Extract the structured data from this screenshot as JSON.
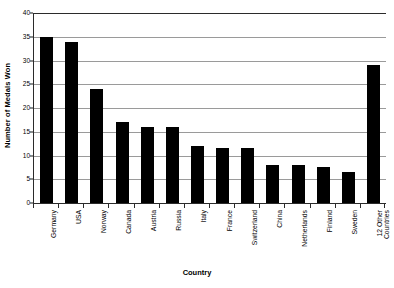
{
  "chart_data": {
    "type": "bar",
    "title": "",
    "xlabel": "Country",
    "ylabel": "Number of Medals Won",
    "categories": [
      "Germany",
      "USA",
      "Norway",
      "Canada",
      "Austria",
      "Russia",
      "Italy",
      "France",
      "Switzerland",
      "China",
      "Netherlands",
      "Finland",
      "Sweden",
      "12 Other\nCountries"
    ],
    "values": [
      35,
      34,
      24,
      17,
      16,
      16,
      12,
      11.5,
      11.5,
      8,
      8,
      7.5,
      6.5,
      29
    ],
    "ylim": [
      0,
      40
    ],
    "ytick_values": [
      0,
      5,
      10,
      15,
      20,
      25,
      30,
      35,
      40
    ],
    "ytick_labels": [
      "0",
      "5",
      "10",
      "15",
      "20",
      "25",
      "30",
      "35",
      "40"
    ],
    "grid": true,
    "grid_axis": "y",
    "legend": false,
    "bar_color": "#000000",
    "gridline_color": "#9a9a9a",
    "axis_color": "#2b2b2b",
    "background": "#ffffff"
  }
}
